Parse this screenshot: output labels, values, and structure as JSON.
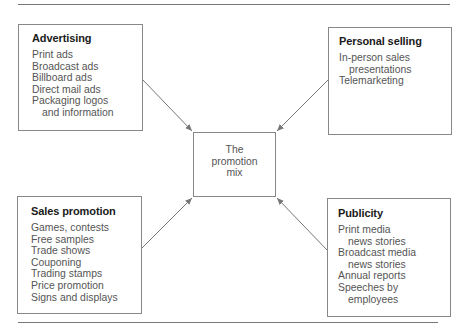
{
  "diagram": {
    "center": {
      "lines": [
        "The",
        "promotion",
        "mix"
      ]
    },
    "boxes": [
      {
        "id": "advertising",
        "title": "Advertising",
        "items": [
          {
            "text": "Print ads",
            "indent": false
          },
          {
            "text": "Broadcast ads",
            "indent": false
          },
          {
            "text": "Billboard ads",
            "indent": false
          },
          {
            "text": "Direct mail ads",
            "indent": false
          },
          {
            "text": "Packaging logos",
            "indent": false
          },
          {
            "text": "and information",
            "indent": true
          }
        ]
      },
      {
        "id": "personal-selling",
        "title": "Personal selling",
        "items": [
          {
            "text": "In-person sales",
            "indent": false
          },
          {
            "text": "presentations",
            "indent": true
          },
          {
            "text": "Telemarketing",
            "indent": false
          }
        ]
      },
      {
        "id": "sales-promotion",
        "title": "Sales promotion",
        "items": [
          {
            "text": "Games, contests",
            "indent": false
          },
          {
            "text": "Free samples",
            "indent": false
          },
          {
            "text": "Trade shows",
            "indent": false
          },
          {
            "text": "Couponing",
            "indent": false
          },
          {
            "text": "Trading stamps",
            "indent": false
          },
          {
            "text": "Price promotion",
            "indent": false
          },
          {
            "text": "Signs and displays",
            "indent": false
          }
        ]
      },
      {
        "id": "publicity",
        "title": "Publicity",
        "items": [
          {
            "text": "Print media",
            "indent": false
          },
          {
            "text": "news stories",
            "indent": true
          },
          {
            "text": "Broadcast media",
            "indent": false
          },
          {
            "text": "news stories",
            "indent": true
          },
          {
            "text": "Annual reports",
            "indent": false
          },
          {
            "text": "Speeches by",
            "indent": false
          },
          {
            "text": "employees",
            "indent": true
          }
        ]
      }
    ],
    "colors": {
      "line": "#777777",
      "title": "#1a1a1a",
      "text": "#555555"
    }
  }
}
